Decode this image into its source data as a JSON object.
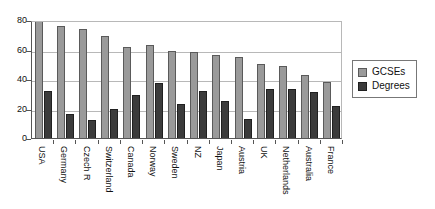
{
  "chart_data": {
    "type": "bar",
    "title": "",
    "subtitle": "",
    "xlabel": "",
    "ylabel": "",
    "ylim": [
      0,
      80
    ],
    "yticks": [
      0,
      20,
      40,
      60,
      80
    ],
    "grid": true,
    "legend_position": "right",
    "clipped_note": "USA GCSEs bar extends above the 80 axis maximum and is clipped by the plot frame",
    "categories": [
      "USA",
      "Germany",
      "Czech R",
      "Switzerland",
      "Canada",
      "Norway",
      "Sweden",
      "NZ",
      "Japan",
      "Austria",
      "UK",
      "Netherlands",
      "Australia",
      "France"
    ],
    "series": [
      {
        "name": "GCSEs",
        "color": "#9a9a9a",
        "values": [
          81,
          76,
          74,
          69,
          62,
          63,
          59,
          58,
          56,
          55,
          50,
          49,
          43,
          38
        ]
      },
      {
        "name": "Degrees",
        "color": "#3b3b3b",
        "values": [
          32,
          16,
          12,
          20,
          29,
          37,
          23,
          32,
          25,
          13,
          33,
          33,
          31,
          22
        ]
      }
    ]
  },
  "legend": {
    "items": [
      {
        "label": "GCSEs",
        "swatch": "gcses"
      },
      {
        "label": "Degrees",
        "swatch": "degrees"
      }
    ]
  }
}
